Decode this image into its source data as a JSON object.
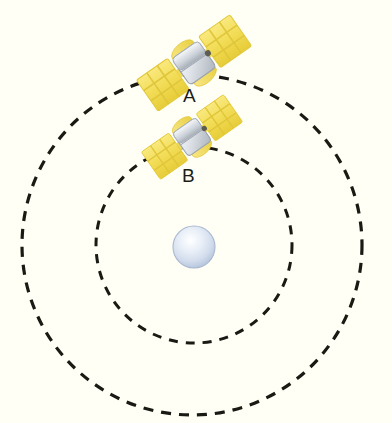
{
  "scene": {
    "title": "Two satellites in circular orbits around a planet",
    "background_color": "#fffff5",
    "width": 392,
    "height": 423
  },
  "planet": {
    "name": "central-planet",
    "center_x": 194,
    "center_y": 247,
    "radius": 21,
    "fill_center": "#fdfeff",
    "fill_mid": "#d9e2f0",
    "fill_edge": "#b9c6dc",
    "stroke": "#a9b8d0"
  },
  "orbits": [
    {
      "name": "outer-orbit",
      "center_x": 192,
      "center_y": 245,
      "radius": 170,
      "stroke": "#1a1a14",
      "stroke_width": 3.2,
      "dash": "10 8",
      "style": "dashed"
    },
    {
      "name": "inner-orbit",
      "center_x": 194,
      "center_y": 245,
      "radius": 98,
      "stroke": "#1a1a14",
      "stroke_width": 3.0,
      "dash": "9 8",
      "style": "dashed"
    }
  ],
  "satellites": [
    {
      "id": "A",
      "label": "A",
      "name": "satellite-a",
      "orbit": "outer-orbit",
      "center_x": 194,
      "center_y": 63,
      "rotation_deg": -35,
      "scale": 1.0,
      "panel_color_light": "#f7e36a",
      "panel_color_dark": "#e8cf3d",
      "panel_cell_color": "#f3dd55",
      "body_color_light": "#f2f4f6",
      "body_color_dark": "#b6bcc4",
      "label_x": 183,
      "label_y": 86
    },
    {
      "id": "B",
      "label": "B",
      "name": "satellite-b",
      "orbit": "inner-orbit",
      "center_x": 192,
      "center_y": 137,
      "rotation_deg": -35,
      "scale": 0.88,
      "panel_color_light": "#f7e36a",
      "panel_color_dark": "#e8cf3d",
      "panel_cell_color": "#f3dd55",
      "body_color_light": "#f2f4f6",
      "body_color_dark": "#b6bcc4",
      "label_x": 182,
      "label_y": 166
    }
  ],
  "labels": {
    "satellite_a": "A",
    "satellite_b": "B"
  }
}
